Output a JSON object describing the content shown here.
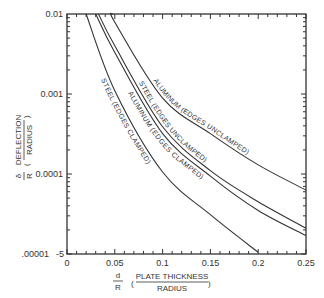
{
  "chart_data": {
    "type": "line",
    "title": "",
    "xlabel": "d/R (Plate Thickness / Radius)",
    "xlabel_parts": {
      "symbol_num": "d",
      "symbol_den": "R",
      "text_num": "PLATE THICKNESS",
      "text_den": "RADIUS"
    },
    "ylabel": "δ/R (Deflection / Radius)",
    "ylabel_parts": {
      "symbol_num": "δ",
      "symbol_den": "R",
      "text_num": "DEFLECTION",
      "text_den": "RADIUS"
    },
    "xlim": [
      0,
      0.25
    ],
    "ylim": [
      1e-05,
      0.01
    ],
    "yscale": "log",
    "grid": false,
    "x_ticks": [
      "0",
      "0.05",
      "0.1",
      "0.15",
      "0.2",
      "0.25"
    ],
    "y_ticks": [
      "0.01",
      "0.001",
      "0.0001",
      ".00001"
    ],
    "y_tick_extra": "-5",
    "series": [
      {
        "name": "ALUMINUM (EDGES UNCLAMPED)",
        "x": [
          0.048,
          0.05,
          0.1,
          0.15,
          0.2,
          0.25
        ],
        "y": [
          0.01,
          0.0079,
          0.00089,
          0.00032,
          0.00013,
          6.3e-05
        ]
      },
      {
        "name": "STEEL (EDGES UNCLAMPED)",
        "x": [
          0.033,
          0.05,
          0.1,
          0.15,
          0.2,
          0.25
        ],
        "y": [
          0.01,
          0.004,
          0.00039,
          0.00011,
          4.5e-05,
          2.1e-05
        ]
      },
      {
        "name": "ALUMINUM (EDGES CLAMPED)",
        "x": [
          0.03,
          0.05,
          0.1,
          0.15,
          0.2,
          0.25
        ],
        "y": [
          0.01,
          0.0033,
          0.00032,
          9.4e-05,
          3.5e-05,
          1.7e-05
        ]
      },
      {
        "name": "STEEL (EDGES CLAMPED)",
        "x": [
          0.02,
          0.05,
          0.1,
          0.15,
          0.2
        ],
        "y": [
          0.01,
          0.0011,
          0.000106,
          3.1e-05,
          1.05e-05
        ]
      }
    ],
    "legend": "inline labels along curves"
  }
}
